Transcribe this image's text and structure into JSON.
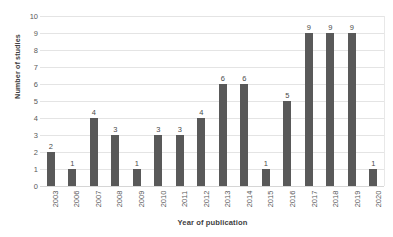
{
  "chart_data": {
    "type": "bar",
    "title": "",
    "xlabel": "Year of publication",
    "ylabel": "Number of studies",
    "categories": [
      "2003",
      "2006",
      "2007",
      "2008",
      "2009",
      "2010",
      "2011",
      "2012",
      "2013",
      "2014",
      "2015",
      "2016",
      "2017",
      "2018",
      "2019",
      "2020"
    ],
    "values": [
      2,
      1,
      4,
      3,
      1,
      3,
      3,
      4,
      6,
      6,
      1,
      5,
      9,
      9,
      9,
      1
    ],
    "ylim": [
      0,
      10
    ],
    "yticks": [
      0,
      1,
      2,
      3,
      4,
      5,
      6,
      7,
      8,
      9,
      10
    ],
    "grid": "horizontal",
    "legend": "none",
    "data_labels": [
      "2",
      "1",
      "4",
      "3",
      "1",
      "3",
      "3",
      "4",
      "6",
      "6",
      "1",
      "5",
      "9",
      "9",
      "9",
      "1"
    ],
    "colors": {
      "bar": "#595959",
      "gridline": "#e4e4e4",
      "baseline": "#d6d6d6",
      "text": "#3f3f3f",
      "tick_text": "#595959",
      "background": "#ffffff"
    }
  }
}
